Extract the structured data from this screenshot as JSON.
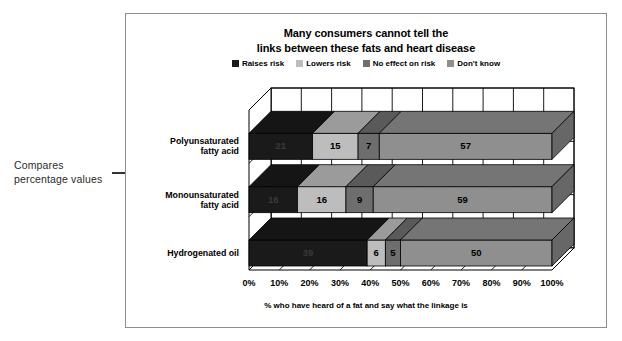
{
  "annotation": {
    "line1": "Compares",
    "line2": "percentage values",
    "arrow_icon": "left-right-arrow-icon"
  },
  "chart_data": {
    "type": "bar",
    "orientation": "horizontal",
    "stacked": true,
    "style": "3d",
    "title_line1": "Many consumers cannot tell the",
    "title_line2": "links between these fats and heart disease",
    "xlabel": "% who have heard of a fat and say what the linkage is",
    "ylabel": "",
    "xlim": [
      0,
      100
    ],
    "grid": true,
    "legend_position": "top",
    "categories": [
      "Polyunsaturated fatty acid",
      "Monounsaturated fatty acid",
      "Hydrogenated oil"
    ],
    "category_lines": [
      [
        "Polyunsaturated",
        "fatty acid"
      ],
      [
        "Monounsaturated",
        "fatty acid"
      ],
      [
        "Hydrogenated oil"
      ]
    ],
    "series": [
      {
        "name": "Raises risk",
        "color": "#1a1a1a",
        "values": [
          21,
          16,
          39
        ]
      },
      {
        "name": "Lowers risk",
        "color": "#bdbdbd",
        "values": [
          15,
          16,
          6
        ]
      },
      {
        "name": "No effect on risk",
        "color": "#6e6e6e",
        "values": [
          7,
          9,
          5
        ]
      },
      {
        "name": "Don't know",
        "color": "#8f8f8f",
        "values": [
          57,
          59,
          50
        ]
      }
    ],
    "xticks": [
      "0%",
      "10%",
      "20%",
      "30%",
      "40%",
      "50%",
      "60%",
      "70%",
      "80%",
      "90%",
      "100%"
    ],
    "xtick_values": [
      0,
      10,
      20,
      30,
      40,
      50,
      60,
      70,
      80,
      90,
      100
    ]
  }
}
